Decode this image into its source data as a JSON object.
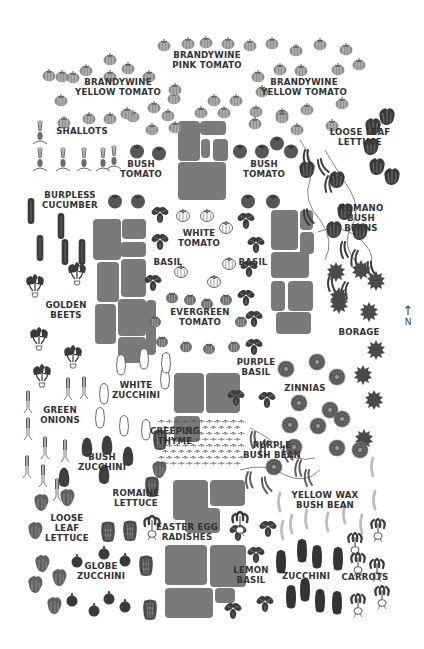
{
  "colors": {
    "plant_dark": "#3a3a3a",
    "plant_mid": "#6a6a6a",
    "tomato_gray": "#8c8c8c",
    "stone": "#7a7a7a",
    "text": "#333333",
    "background": "#ffffff"
  },
  "compass": {
    "arrow": "↑",
    "label": "N"
  },
  "labels": [
    {
      "id": "brandywine-pink-tomato",
      "text": "BRANDYWINE\nPINK TOMATO",
      "x": 207,
      "y": 59
    },
    {
      "id": "brandywine-yellow-tomato-left",
      "text": "BRANDYWINE\nYELLOW TOMATO",
      "x": 118,
      "y": 86
    },
    {
      "id": "brandywine-yellow-tomato-right",
      "text": "BRANDYWINE\nYELLOW TOMATO",
      "x": 304,
      "y": 86
    },
    {
      "id": "shallots",
      "text": "SHALLOTS",
      "x": 82,
      "y": 135
    },
    {
      "id": "loose-leaf-lettuce-top",
      "text": "LOOSE LEAF\nLETTUCE",
      "x": 360,
      "y": 136
    },
    {
      "id": "bush-tomato-left",
      "text": "BUSH\nTOMATO",
      "x": 141,
      "y": 168
    },
    {
      "id": "bush-tomato-right",
      "text": "BUSH\nTOMATO",
      "x": 264,
      "y": 168
    },
    {
      "id": "burpless-cucumber",
      "text": "BURPLESS\nCUCUMBER",
      "x": 70,
      "y": 199
    },
    {
      "id": "romano-bush-beans",
      "text": "ROMANO\nBUSH\nBEANS",
      "x": 361,
      "y": 212
    },
    {
      "id": "white-tomato",
      "text": "WHITE\nTOMATO",
      "x": 199,
      "y": 237
    },
    {
      "id": "basil-left",
      "text": "BASIL",
      "x": 168,
      "y": 266
    },
    {
      "id": "basil-right",
      "text": "BASIL",
      "x": 253,
      "y": 266
    },
    {
      "id": "golden-beets",
      "text": "GOLDEN\nBEETS",
      "x": 66,
      "y": 309
    },
    {
      "id": "evergreen-tomato",
      "text": "EVERGREEN\nTOMATO",
      "x": 200,
      "y": 316
    },
    {
      "id": "borage",
      "text": "BORAGE",
      "x": 359,
      "y": 336
    },
    {
      "id": "purple-basil",
      "text": "PURPLE\nBASIL",
      "x": 256,
      "y": 366
    },
    {
      "id": "white-zucchini",
      "text": "WHITE\nZUCCHINI",
      "x": 136,
      "y": 389
    },
    {
      "id": "zinnias",
      "text": "ZINNIAS",
      "x": 305,
      "y": 392
    },
    {
      "id": "green-onions",
      "text": "GREEN\nONIONS",
      "x": 60,
      "y": 414
    },
    {
      "id": "creeping-thyme",
      "text": "CREEPING\nTHYME",
      "x": 175,
      "y": 435
    },
    {
      "id": "purple-bush-bean",
      "text": "PURPLE\nBUSH BEAN",
      "x": 272,
      "y": 449
    },
    {
      "id": "bush-zucchini",
      "text": "BUSH\nZUCCHINI",
      "x": 102,
      "y": 461
    },
    {
      "id": "yellow-wax-bush-bean",
      "text": "YELLOW WAX\nBUSH BEAN",
      "x": 325,
      "y": 499
    },
    {
      "id": "romaine-lettuce",
      "text": "ROMAINE\nLETTUCE",
      "x": 136,
      "y": 497
    },
    {
      "id": "loose-leaf-lettuce-bottom",
      "text": "LOOSE\nLEAF\nLETTUCE",
      "x": 67,
      "y": 522
    },
    {
      "id": "easter-egg-radishes",
      "text": "EASTER EGG\nRADISHES",
      "x": 187,
      "y": 531
    },
    {
      "id": "globe-zucchini",
      "text": "GLOBE\nZUCCHINI",
      "x": 101,
      "y": 570
    },
    {
      "id": "lemon-basil",
      "text": "LEMON\nBASIL",
      "x": 251,
      "y": 574
    },
    {
      "id": "zucchini",
      "text": "ZUCCHINI",
      "x": 306,
      "y": 580
    },
    {
      "id": "carrots",
      "text": "CARROTS",
      "x": 365,
      "y": 581
    }
  ],
  "plants": {
    "gray_tomato": [
      [
        62,
        75
      ],
      [
        86,
        69
      ],
      [
        110,
        58
      ],
      [
        128,
        67
      ],
      [
        164,
        44
      ],
      [
        188,
        42
      ],
      [
        206,
        41
      ],
      [
        228,
        42
      ],
      [
        250,
        44
      ],
      [
        272,
        42
      ],
      [
        296,
        49
      ],
      [
        320,
        43
      ],
      [
        346,
        48
      ],
      [
        49,
        74
      ],
      [
        73,
        76
      ],
      [
        110,
        75
      ],
      [
        149,
        75
      ],
      [
        174,
        97
      ],
      [
        214,
        99
      ],
      [
        236,
        99
      ],
      [
        262,
        90
      ],
      [
        258,
        75
      ],
      [
        280,
        68
      ],
      [
        301,
        69
      ],
      [
        338,
        68
      ],
      [
        359,
        63
      ],
      [
        61,
        99
      ],
      [
        175,
        88
      ],
      [
        154,
        106
      ],
      [
        201,
        111
      ],
      [
        224,
        111
      ],
      [
        256,
        110
      ],
      [
        282,
        113
      ],
      [
        307,
        108
      ],
      [
        342,
        102
      ],
      [
        64,
        121
      ],
      [
        89,
        117
      ],
      [
        110,
        117
      ],
      [
        133,
        115
      ],
      [
        152,
        128
      ],
      [
        175,
        126
      ],
      [
        255,
        122
      ],
      [
        282,
        116
      ],
      [
        297,
        128
      ],
      [
        332,
        124
      ],
      [
        127,
        112
      ],
      [
        168,
        114
      ]
    ],
    "dark_tomato": [
      [
        137,
        150
      ],
      [
        159,
        152
      ],
      [
        115,
        200
      ],
      [
        138,
        200
      ],
      [
        248,
        200
      ],
      [
        273,
        200
      ],
      [
        240,
        150
      ],
      [
        262,
        150
      ],
      [
        277,
        142
      ],
      [
        291,
        150
      ]
    ],
    "white_tomato": [
      [
        183,
        214
      ],
      [
        207,
        214
      ],
      [
        226,
        226
      ],
      [
        181,
        270
      ],
      [
        229,
        262
      ],
      [
        214,
        280
      ]
    ],
    "evergreen_tomato": [
      [
        172,
        296
      ],
      [
        190,
        298
      ],
      [
        207,
        302
      ],
      [
        226,
        298
      ],
      [
        155,
        320
      ],
      [
        241,
        320
      ],
      [
        162,
        340
      ],
      [
        186,
        345
      ],
      [
        209,
        347
      ],
      [
        234,
        345
      ]
    ],
    "basil": [
      [
        160,
        214
      ],
      [
        160,
        241
      ],
      [
        153,
        282
      ],
      [
        246,
        220
      ],
      [
        256,
        244
      ],
      [
        249,
        268
      ],
      [
        246,
        297
      ],
      [
        254,
        318
      ],
      [
        254,
        346
      ],
      [
        236,
        397
      ],
      [
        267,
        399
      ],
      [
        238,
        532
      ],
      [
        268,
        528
      ],
      [
        256,
        554
      ],
      [
        233,
        610
      ],
      [
        265,
        603
      ]
    ],
    "lettuce_dark": [
      [
        373,
        127
      ],
      [
        387,
        117
      ],
      [
        371,
        147
      ],
      [
        377,
        167
      ],
      [
        392,
        177
      ],
      [
        307,
        170
      ],
      [
        337,
        180
      ],
      [
        334,
        230
      ],
      [
        360,
        232
      ],
      [
        345,
        212
      ]
    ],
    "shallot": [
      [
        40,
        135
      ],
      [
        40,
        162
      ],
      [
        63,
        162
      ],
      [
        84,
        162
      ],
      [
        103,
        162
      ],
      [
        114,
        160
      ]
    ],
    "cucumber": [
      [
        31,
        211
      ],
      [
        61,
        226
      ],
      [
        40,
        248
      ],
      [
        65,
        252
      ],
      [
        82,
        252
      ]
    ],
    "beet": [
      [
        35,
        288
      ],
      [
        77,
        276
      ],
      [
        39,
        341
      ],
      [
        73,
        359
      ],
      [
        42,
        378
      ]
    ],
    "white_zucchini": [
      [
        121,
        366
      ],
      [
        144,
        360
      ],
      [
        165,
        380
      ],
      [
        104,
        395
      ],
      [
        166,
        364
      ],
      [
        100,
        419
      ],
      [
        124,
        427
      ],
      [
        146,
        431
      ]
    ],
    "green_onion": [
      [
        28,
        403
      ],
      [
        28,
        430
      ],
      [
        27,
        468
      ],
      [
        68,
        390
      ],
      [
        84,
        389
      ],
      [
        45,
        449
      ],
      [
        65,
        452
      ],
      [
        43,
        477
      ],
      [
        57,
        491
      ]
    ],
    "bush_zucchini": [
      [
        87,
        448
      ],
      [
        107,
        446
      ],
      [
        128,
        457
      ],
      [
        104,
        475
      ],
      [
        64,
        478
      ]
    ],
    "romaine": [
      [
        108,
        532
      ],
      [
        130,
        531
      ],
      [
        146,
        566
      ],
      [
        150,
        610
      ],
      [
        152,
        487
      ],
      [
        160,
        440
      ]
    ],
    "loose_lettuce": [
      [
        41,
        503
      ],
      [
        67,
        498
      ],
      [
        35,
        531
      ],
      [
        42,
        564
      ],
      [
        59,
        578
      ],
      [
        35,
        585
      ],
      [
        54,
        606
      ],
      [
        159,
        470
      ]
    ],
    "globe_zucchini": [
      [
        77,
        561
      ],
      [
        104,
        553
      ],
      [
        125,
        560
      ],
      [
        72,
        600
      ],
      [
        94,
        610
      ],
      [
        109,
        598
      ],
      [
        125,
        606
      ]
    ],
    "radish_top": [
      [
        152,
        529
      ],
      [
        240,
        525
      ]
    ],
    "borage": [
      [
        336,
        270
      ],
      [
        361,
        268
      ],
      [
        376,
        279
      ],
      [
        339,
        295
      ],
      [
        369,
        310
      ],
      [
        376,
        348
      ],
      [
        363,
        373
      ],
      [
        374,
        398
      ],
      [
        364,
        437
      ],
      [
        339,
        302
      ]
    ],
    "zinnia": [
      [
        286,
        369
      ],
      [
        317,
        362
      ],
      [
        337,
        377
      ],
      [
        299,
        403
      ],
      [
        330,
        410
      ],
      [
        290,
        425
      ],
      [
        318,
        426
      ],
      [
        342,
        419
      ],
      [
        337,
        448
      ],
      [
        360,
        450
      ],
      [
        274,
        467
      ],
      [
        294,
        447
      ]
    ],
    "yellow_bean": [
      [
        280,
        502
      ],
      [
        292,
        524
      ],
      [
        307,
        519
      ],
      [
        328,
        522
      ],
      [
        345,
        514
      ],
      [
        362,
        524
      ],
      [
        375,
        500
      ],
      [
        283,
        530
      ],
      [
        373,
        467
      ]
    ],
    "zucchini": [
      [
        281,
        562
      ],
      [
        302,
        551
      ],
      [
        317,
        557
      ],
      [
        338,
        559
      ],
      [
        291,
        597
      ],
      [
        305,
        590
      ],
      [
        320,
        601
      ],
      [
        337,
        603
      ]
    ],
    "carrot": [
      [
        355,
        546
      ],
      [
        378,
        532
      ],
      [
        358,
        566
      ],
      [
        377,
        572
      ],
      [
        358,
        607
      ],
      [
        382,
        599
      ]
    ]
  },
  "stones": [
    [
      178,
      121,
      22,
      40
    ],
    [
      200,
      121,
      26,
      14
    ],
    [
      201,
      139,
      9,
      19
    ],
    [
      213,
      139,
      15,
      22
    ],
    [
      178,
      162,
      48,
      38
    ],
    [
      93,
      219,
      28,
      41
    ],
    [
      122,
      219,
      24,
      20
    ],
    [
      120,
      242,
      26,
      15
    ],
    [
      97,
      262,
      22,
      40
    ],
    [
      121,
      259,
      25,
      38
    ],
    [
      95,
      304,
      21,
      40
    ],
    [
      118,
      299,
      28,
      37
    ],
    [
      118,
      337,
      28,
      26
    ],
    [
      146,
      300,
      10,
      55
    ],
    [
      271,
      210,
      27,
      40
    ],
    [
      300,
      210,
      13,
      20
    ],
    [
      300,
      232,
      14,
      22
    ],
    [
      271,
      252,
      38,
      26
    ],
    [
      271,
      281,
      14,
      30
    ],
    [
      288,
      281,
      25,
      30
    ],
    [
      276,
      312,
      35,
      22
    ],
    [
      174,
      373,
      30,
      40
    ],
    [
      206,
      373,
      34,
      40
    ],
    [
      174,
      416,
      26,
      26
    ],
    [
      173,
      480,
      35,
      40
    ],
    [
      210,
      480,
      35,
      26
    ],
    [
      185,
      508,
      35,
      25
    ],
    [
      165,
      545,
      42,
      40
    ],
    [
      210,
      545,
      36,
      42
    ],
    [
      165,
      588,
      48,
      30
    ],
    [
      215,
      588,
      20,
      15
    ]
  ],
  "thyme_area": {
    "x": 160,
    "y": 422,
    "w": 85,
    "h": 48
  },
  "romano_vines": [
    [
      290,
      130,
      340,
      260
    ]
  ],
  "purple_vines": [
    [
      240,
      420,
      320,
      470
    ]
  ]
}
